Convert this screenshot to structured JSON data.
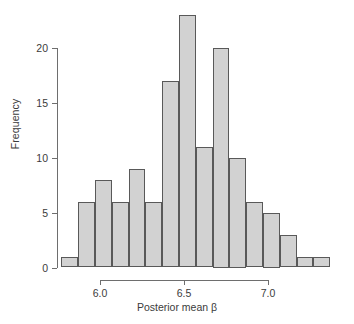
{
  "chart_data": {
    "type": "bar",
    "title": "",
    "subtitle": "",
    "xlabel": "Posterior mean β",
    "ylabel": "Frequency",
    "xlim": [
      5.77,
      7.375
    ],
    "ylim": [
      0,
      23
    ],
    "grid": false,
    "legend": null,
    "bin_width": 0.1,
    "bin_edges": [
      5.77,
      5.87,
      5.97,
      6.07,
      6.17,
      6.27,
      6.37,
      6.47,
      6.57,
      6.67,
      6.77,
      6.87,
      6.97,
      7.07,
      7.17,
      7.27,
      7.37
    ],
    "categories": [
      "5.77-5.87",
      "5.87-5.97",
      "5.97-6.07",
      "6.07-6.17",
      "6.17-6.27",
      "6.27-6.37",
      "6.37-6.47",
      "6.47-6.57",
      "6.57-6.67",
      "6.67-6.77",
      "6.77-6.87",
      "6.87-6.97",
      "6.97-7.07",
      "7.07-7.17",
      "7.17-7.27",
      "7.27-7.37"
    ],
    "values": [
      1,
      6,
      8,
      6,
      9,
      6,
      17,
      23,
      11,
      20,
      10,
      6,
      5,
      3,
      1,
      1
    ],
    "x_ticks": [
      {
        "value": 6.0,
        "label": "6.0"
      },
      {
        "value": 6.5,
        "label": "6.5"
      },
      {
        "value": 7.0,
        "label": "7.0"
      }
    ],
    "y_ticks": [
      {
        "value": 0,
        "label": "0"
      },
      {
        "value": 5,
        "label": "5"
      },
      {
        "value": 10,
        "label": "10"
      },
      {
        "value": 15,
        "label": "15"
      },
      {
        "value": 20,
        "label": "20"
      }
    ],
    "bar_fill_color": "#d2d2d2",
    "bar_edge_color": "#595959",
    "axis_color": "#6e6e6e",
    "text_color": "#3b3b3b",
    "background_color": "#ffffff"
  }
}
